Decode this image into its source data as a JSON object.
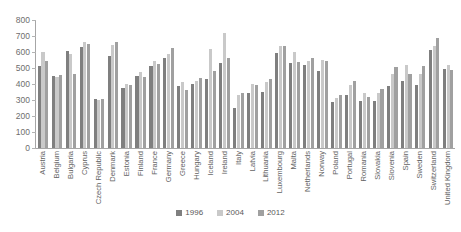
{
  "chart_data": {
    "type": "bar",
    "title": "",
    "xlabel": "",
    "ylabel": "",
    "ylim": [
      0,
      800
    ],
    "yticks": [
      800,
      700,
      600,
      500,
      400,
      300,
      200,
      100,
      0
    ],
    "grid": false,
    "legend_position": "bottom",
    "categories": [
      "Austria",
      "Belgium",
      "Bulgaria",
      "Cyprus",
      "Czech Republic",
      "Denmark",
      "Estonia",
      "Finland",
      "France",
      "Germany",
      "Greece",
      "Hungary",
      "Iceland",
      "Ireland",
      "Italy",
      "Latvia",
      "Lithuania",
      "Luxembourg",
      "Malta",
      "Netherlands",
      "Norway",
      "Poland",
      "Portugal",
      "Romania",
      "Slovakia",
      "Slovenia",
      "Spain",
      "Sweden",
      "Switzerland",
      "United Kingdom"
    ],
    "series": [
      {
        "name": "1996",
        "color": "#7f7f7f",
        "values": [
          510,
          450,
          605,
          630,
          305,
          575,
          375,
          450,
          510,
          560,
          390,
          400,
          430,
          530,
          250,
          345,
          350,
          595,
          530,
          520,
          480,
          290,
          330,
          295,
          295,
          390,
          420,
          395,
          615,
          495
        ]
      },
      {
        "name": "2004",
        "color": "#c9c9c9",
        "values": [
          600,
          445,
          590,
          660,
          300,
          645,
          400,
          475,
          545,
          590,
          415,
          420,
          620,
          720,
          330,
          400,
          415,
          640,
          600,
          545,
          550,
          310,
          395,
          345,
          345,
          460,
          520,
          460,
          640,
          520
        ]
      },
      {
        "name": "2012",
        "color": "#a0a0a0",
        "values": [
          545,
          455,
          460,
          650,
          305,
          660,
          395,
          445,
          525,
          625,
          365,
          440,
          480,
          565,
          345,
          395,
          430,
          640,
          540,
          560,
          545,
          330,
          420,
          320,
          370,
          505,
          465,
          510,
          690,
          490
        ]
      }
    ]
  },
  "legend": {
    "entries": [
      {
        "label": "1996"
      },
      {
        "label": "2004"
      },
      {
        "label": "2012"
      }
    ]
  }
}
